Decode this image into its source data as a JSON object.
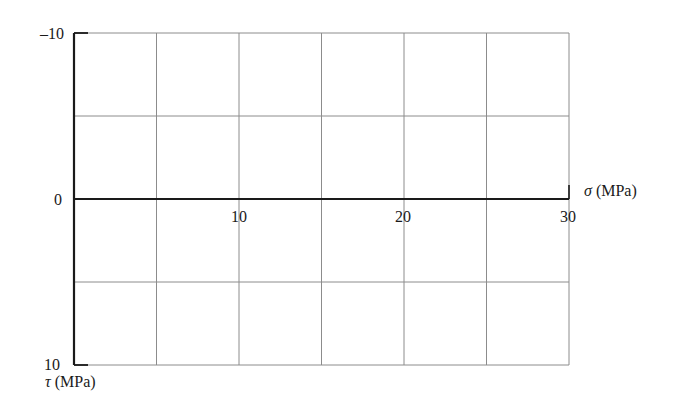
{
  "chart_data": {
    "type": "line",
    "title": "",
    "xlabel": "σ (MPa)",
    "ylabel": "τ (MPa)",
    "xlim": [
      0,
      30
    ],
    "ylim": [
      -10,
      10
    ],
    "y_inverted": true,
    "grid": true,
    "x_grid_step": 5,
    "y_grid_step": 5,
    "x_tick_labels": [
      {
        "value": 10,
        "label": "10"
      },
      {
        "value": 20,
        "label": "20"
      },
      {
        "value": 30,
        "label": "30"
      }
    ],
    "y_tick_labels": [
      {
        "value": -10,
        "label": "–10"
      },
      {
        "value": 0,
        "label": "0"
      },
      {
        "value": 10,
        "label": "10"
      }
    ],
    "series": [],
    "legend": null
  },
  "labels": {
    "x_axis": "σ (MPa)",
    "y_axis": "τ (MPa)",
    "y_top": "–10",
    "y_zero": "0",
    "y_bottom": "10",
    "x_10": "10",
    "x_20": "20",
    "x_30": "30"
  },
  "colors": {
    "axis": "#1a1a1a",
    "grid": "#8c8c8c"
  }
}
